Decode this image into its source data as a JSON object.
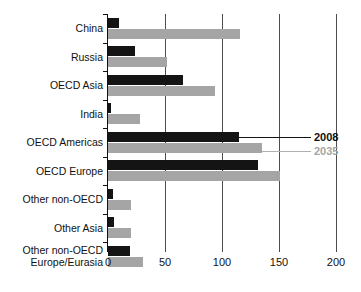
{
  "chart_data": {
    "type": "bar",
    "orientation": "horizontal",
    "title": "",
    "subtitle": "",
    "xlabel": "",
    "ylabel": "",
    "xlim": [
      0,
      200
    ],
    "xticks": [
      0,
      50,
      100,
      150,
      200
    ],
    "xtick_labels": [
      "0",
      "50",
      "100",
      "150",
      "200"
    ],
    "grid": "vertical",
    "legend_position": "inline-callout",
    "categories": [
      "China",
      "Russia",
      "OECD Asia",
      "India",
      "OECD Americas",
      "OECD Europe",
      "Other non-OECD",
      "Other Asia",
      "Other non-OECD Europe/Eurasia"
    ],
    "series": [
      {
        "name": "2008",
        "color": "#141414",
        "values": [
          10,
          24,
          66,
          3,
          115,
          132,
          4,
          5,
          19
        ]
      },
      {
        "name": "2035",
        "color": "#a5a5a5",
        "values": [
          116,
          52,
          94,
          28,
          135,
          151,
          20,
          20,
          31
        ]
      }
    ]
  },
  "labels": {
    "category_lines": [
      [
        "China"
      ],
      [
        "Russia"
      ],
      [
        "OECD Asia"
      ],
      [
        "India"
      ],
      [
        "OECD Americas"
      ],
      [
        "OECD Europe"
      ],
      [
        "Other non-OECD"
      ],
      [
        "Other Asia"
      ],
      [
        "Other non-OECD",
        "Europe/Eurasia"
      ]
    ]
  },
  "legend": {
    "series_2008_label": "2008",
    "series_2035_label": "2035"
  },
  "axis": {
    "tick_0": "0",
    "tick_50": "50",
    "tick_100": "100",
    "tick_150": "150",
    "tick_200": "200"
  }
}
